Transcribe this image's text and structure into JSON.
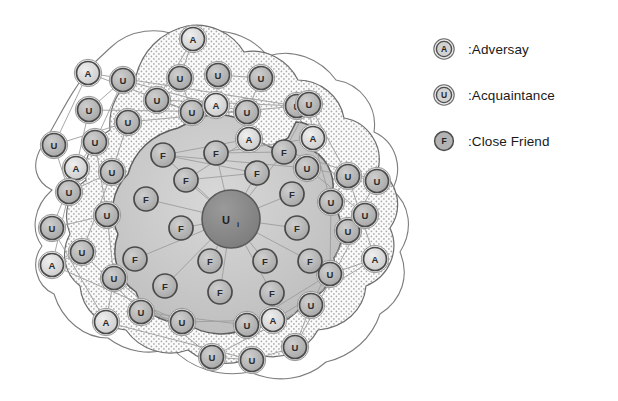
{
  "figure": {
    "center_node": {
      "label": "U",
      "subscript": "i",
      "name": "center-user-node"
    }
  },
  "legend": {
    "name": "legend",
    "items": [
      {
        "glyph": "A",
        "label": ":Adversay",
        "key": "adversary"
      },
      {
        "glyph": "U",
        "label": ":Acquaintance",
        "key": "acquaintance"
      },
      {
        "glyph": "F",
        "label": ":Close Friend",
        "key": "close-friend"
      }
    ]
  },
  "colors": {
    "node_fill": "#b0b0b0",
    "node_fill_light": "#dcdcdc",
    "node_stroke": "#4a4a4a",
    "center_fill": "#8a8a8a",
    "zone_outer_fill": "#ffffff",
    "zone_dotted_fill": "#f2f2f2",
    "zone_inner_fill": "#cfcfcf",
    "zone_inner2_fill": "#bdbdbd",
    "edge": "#9a9a9a",
    "boundary": "#6e6e6e",
    "text": "#1a1a1a"
  },
  "zones": [
    {
      "key": "outer-acquaintance-zone",
      "label": "outer zone"
    },
    {
      "key": "dotted-acquaintance-zone",
      "label": "acquaintance zone"
    },
    {
      "key": "close-friend-zone",
      "label": "close friend zone"
    }
  ],
  "edges": [
    [
      0,
      1
    ],
    [
      0,
      4
    ],
    [
      1,
      5
    ],
    [
      2,
      3
    ],
    [
      2,
      6
    ],
    [
      3,
      7
    ],
    [
      4,
      5
    ],
    [
      4,
      8
    ],
    [
      5,
      9
    ],
    [
      6,
      7
    ],
    [
      6,
      10
    ],
    [
      7,
      11
    ],
    [
      8,
      9
    ],
    [
      8,
      12
    ],
    [
      9,
      13
    ],
    [
      10,
      11
    ],
    [
      10,
      14
    ],
    [
      11,
      15
    ],
    [
      12,
      13
    ],
    [
      12,
      16
    ],
    [
      13,
      17
    ],
    [
      14,
      15
    ],
    [
      14,
      18
    ],
    [
      15,
      19
    ],
    [
      16,
      17
    ],
    [
      16,
      20
    ],
    [
      17,
      21
    ],
    [
      18,
      19
    ],
    [
      18,
      22
    ],
    [
      19,
      23
    ],
    [
      20,
      21
    ],
    [
      20,
      24
    ],
    [
      21,
      25
    ],
    [
      22,
      23
    ],
    [
      22,
      26
    ],
    [
      23,
      27
    ],
    [
      24,
      25
    ],
    [
      24,
      28
    ],
    [
      25,
      29
    ],
    [
      26,
      27
    ],
    [
      26,
      30
    ],
    [
      27,
      31
    ],
    [
      28,
      29
    ],
    [
      28,
      32
    ],
    [
      29,
      33
    ],
    [
      30,
      31
    ],
    [
      30,
      34
    ],
    [
      31,
      35
    ],
    [
      32,
      33
    ],
    [
      32,
      36
    ],
    [
      33,
      37
    ],
    [
      34,
      35
    ],
    [
      34,
      38
    ],
    [
      35,
      39
    ],
    [
      36,
      37
    ],
    [
      36,
      40
    ],
    [
      37,
      41
    ],
    [
      38,
      39
    ],
    [
      38,
      42
    ],
    [
      39,
      43
    ],
    [
      40,
      41
    ],
    [
      40,
      44
    ],
    [
      41,
      45
    ],
    [
      42,
      43
    ],
    [
      42,
      46
    ],
    [
      43,
      47
    ],
    [
      44,
      45
    ],
    [
      46,
      47
    ]
  ],
  "nodes": [
    {
      "id": "n1",
      "type": "A",
      "x": 193,
      "y": 39,
      "zone": "dotted"
    },
    {
      "id": "n2",
      "type": "U",
      "x": 180,
      "y": 78,
      "zone": "dotted"
    },
    {
      "id": "n3",
      "type": "U",
      "x": 218,
      "y": 75,
      "zone": "dotted"
    },
    {
      "id": "n4",
      "type": "U",
      "x": 261,
      "y": 78,
      "zone": "dotted"
    },
    {
      "id": "n5",
      "type": "U",
      "x": 157,
      "y": 100,
      "zone": "dotted"
    },
    {
      "id": "n6",
      "type": "U",
      "x": 192,
      "y": 112,
      "zone": "dotted"
    },
    {
      "id": "n7",
      "type": "A",
      "x": 216,
      "y": 105,
      "zone": "dotted"
    },
    {
      "id": "n8",
      "type": "U",
      "x": 247,
      "y": 112,
      "zone": "dotted"
    },
    {
      "id": "n9",
      "type": "U",
      "x": 297,
      "y": 106,
      "zone": "dotted"
    },
    {
      "id": "n10",
      "type": "A",
      "x": 88,
      "y": 73,
      "zone": "outer"
    },
    {
      "id": "n11",
      "type": "U",
      "x": 123,
      "y": 80,
      "zone": "outer"
    },
    {
      "id": "n12",
      "type": "U",
      "x": 89,
      "y": 110,
      "zone": "outer"
    },
    {
      "id": "n13",
      "type": "U",
      "x": 128,
      "y": 122,
      "zone": "outer"
    },
    {
      "id": "n14",
      "type": "U",
      "x": 54,
      "y": 145,
      "zone": "outer"
    },
    {
      "id": "n15",
      "type": "U",
      "x": 95,
      "y": 142,
      "zone": "outer"
    },
    {
      "id": "n16",
      "type": "A",
      "x": 76,
      "y": 168,
      "zone": "outer"
    },
    {
      "id": "n17",
      "type": "U",
      "x": 112,
      "y": 172,
      "zone": "dotted"
    },
    {
      "id": "n18",
      "type": "U",
      "x": 69,
      "y": 192,
      "zone": "dotted"
    },
    {
      "id": "n19",
      "type": "U",
      "x": 107,
      "y": 215,
      "zone": "dotted"
    },
    {
      "id": "n20",
      "type": "U",
      "x": 52,
      "y": 228,
      "zone": "dotted"
    },
    {
      "id": "n21",
      "type": "U",
      "x": 82,
      "y": 252,
      "zone": "dotted"
    },
    {
      "id": "n22",
      "type": "A",
      "x": 52,
      "y": 265,
      "zone": "dotted"
    },
    {
      "id": "n23",
      "type": "U",
      "x": 114,
      "y": 278,
      "zone": "dotted"
    },
    {
      "id": "n24",
      "type": "A",
      "x": 106,
      "y": 322,
      "zone": "dotted"
    },
    {
      "id": "n25",
      "type": "U",
      "x": 141,
      "y": 312,
      "zone": "dotted"
    },
    {
      "id": "n26",
      "type": "U",
      "x": 182,
      "y": 322,
      "zone": "dotted"
    },
    {
      "id": "n27",
      "type": "U",
      "x": 212,
      "y": 357,
      "zone": "dotted"
    },
    {
      "id": "n28",
      "type": "U",
      "x": 252,
      "y": 360,
      "zone": "dotted"
    },
    {
      "id": "n29",
      "type": "U",
      "x": 247,
      "y": 325,
      "zone": "dotted"
    },
    {
      "id": "n30",
      "type": "A",
      "x": 273,
      "y": 320,
      "zone": "dotted"
    },
    {
      "id": "n31",
      "type": "U",
      "x": 311,
      "y": 305,
      "zone": "dotted"
    },
    {
      "id": "n32",
      "type": "U",
      "x": 295,
      "y": 347,
      "zone": "dotted"
    },
    {
      "id": "n33",
      "type": "U",
      "x": 330,
      "y": 274,
      "zone": "dotted"
    },
    {
      "id": "n34",
      "type": "A",
      "x": 375,
      "y": 259,
      "zone": "dotted"
    },
    {
      "id": "n35",
      "type": "U",
      "x": 348,
      "y": 231,
      "zone": "dotted"
    },
    {
      "id": "n36",
      "type": "U",
      "x": 365,
      "y": 215,
      "zone": "dotted"
    },
    {
      "id": "n37",
      "type": "U",
      "x": 331,
      "y": 202,
      "zone": "dotted"
    },
    {
      "id": "n38",
      "type": "U",
      "x": 348,
      "y": 176,
      "zone": "dotted"
    },
    {
      "id": "n39",
      "type": "U",
      "x": 377,
      "y": 181,
      "zone": "dotted"
    },
    {
      "id": "n40",
      "type": "U",
      "x": 307,
      "y": 168,
      "zone": "dotted"
    },
    {
      "id": "n41",
      "type": "A",
      "x": 313,
      "y": 138,
      "zone": "dotted"
    },
    {
      "id": "n42",
      "type": "U",
      "x": 309,
      "y": 104,
      "zone": "dotted"
    },
    {
      "id": "n43",
      "type": "A",
      "x": 249,
      "y": 139,
      "zone": "dotted"
    },
    {
      "id": "n44",
      "type": "F",
      "x": 163,
      "y": 155,
      "zone": "inner"
    },
    {
      "id": "n45",
      "type": "F",
      "x": 216,
      "y": 153,
      "zone": "inner"
    },
    {
      "id": "n46",
      "type": "F",
      "x": 284,
      "y": 152,
      "zone": "inner"
    },
    {
      "id": "n47",
      "type": "F",
      "x": 186,
      "y": 180,
      "zone": "inner"
    },
    {
      "id": "n48",
      "type": "F",
      "x": 257,
      "y": 173,
      "zone": "inner"
    },
    {
      "id": "n49",
      "type": "F",
      "x": 146,
      "y": 199,
      "zone": "inner"
    },
    {
      "id": "n50",
      "type": "F",
      "x": 292,
      "y": 194,
      "zone": "inner"
    },
    {
      "id": "n51",
      "type": "F",
      "x": 181,
      "y": 228,
      "zone": "inner"
    },
    {
      "id": "n52",
      "type": "F",
      "x": 297,
      "y": 228,
      "zone": "inner"
    },
    {
      "id": "n53",
      "type": "F",
      "x": 135,
      "y": 259,
      "zone": "inner"
    },
    {
      "id": "n54",
      "type": "F",
      "x": 210,
      "y": 261,
      "zone": "inner"
    },
    {
      "id": "n55",
      "type": "F",
      "x": 265,
      "y": 261,
      "zone": "inner"
    },
    {
      "id": "n56",
      "type": "F",
      "x": 310,
      "y": 261,
      "zone": "inner"
    },
    {
      "id": "n57",
      "type": "F",
      "x": 165,
      "y": 286,
      "zone": "inner"
    },
    {
      "id": "n58",
      "type": "F",
      "x": 220,
      "y": 292,
      "zone": "inner"
    },
    {
      "id": "n59",
      "type": "F",
      "x": 272,
      "y": 293,
      "zone": "inner"
    }
  ],
  "center": {
    "x": 231,
    "y": 219,
    "r": 29
  }
}
